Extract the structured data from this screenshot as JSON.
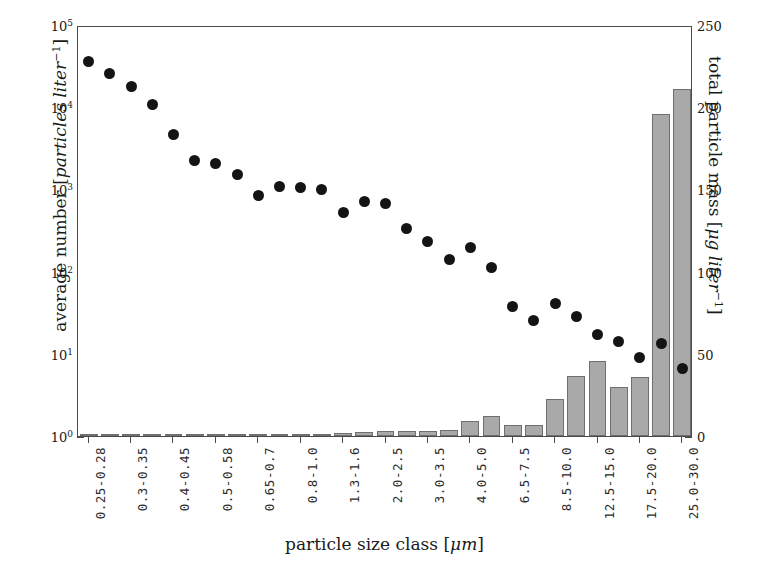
{
  "chart_data": {
    "type": "bar",
    "title": "",
    "xlabel": "particle size class [μm]",
    "ylabel": "average number [particles liter⁻¹]",
    "ylabel_right": "total particle mass [μg liter⁻¹]",
    "yscale": "log",
    "ylim": [
      1,
      100000
    ],
    "ylim_right": [
      0,
      250
    ],
    "grid": false,
    "legend": "none",
    "left_ticklabels": [
      "10⁰",
      "10¹",
      "10²",
      "10³",
      "10⁴",
      "10⁵"
    ],
    "left_tickvalues": [
      1,
      10,
      100,
      1000,
      10000,
      100000
    ],
    "right_ticklabels": [
      "0",
      "50",
      "100",
      "150",
      "200",
      "250"
    ],
    "right_tickvalues": [
      0,
      50,
      100,
      150,
      200,
      250
    ],
    "categories": [
      "0.25-0.28",
      "0.28-0.3",
      "0.3-0.35",
      "0.35-0.4",
      "0.4-0.45",
      "0.45-0.5",
      "0.5-0.58",
      "0.58-0.65",
      "0.65-0.7",
      "0.7-0.8",
      "0.8-1.0",
      "1.0-1.3",
      "1.3-1.6",
      "1.6-2.0",
      "2.0-2.5",
      "2.5-3.0",
      "3.0-3.5",
      "3.5-4.0",
      "4.0-5.0",
      "5.0-6.5",
      "6.5-7.5",
      "7.5-8.5",
      "8.5-10.0",
      "10.0-12.5",
      "12.5-15.0",
      "15.0-17.5",
      "17.5-20.0",
      "20.0-25.0",
      "25.0-30.0"
    ],
    "visible_tick_labels": [
      "0.25-0.28",
      "0.3-0.35",
      "0.4-0.45",
      "0.5-0.58",
      "0.65-0.7",
      "0.8-1.0",
      "1.3-1.6",
      "2.0-2.5",
      "3.0-3.5",
      "4.0-5.0",
      "6.5-7.5",
      "8.5-10.0",
      "12.5-15.0",
      "17.5-20.0",
      "25.0-30.0"
    ],
    "visible_tick_indices": [
      0,
      2,
      4,
      6,
      8,
      10,
      12,
      14,
      16,
      18,
      20,
      22,
      24,
      26,
      28
    ],
    "series": [
      {
        "name": "average number",
        "type": "scatter",
        "axis": "left",
        "unit": "particles liter^-1",
        "color": "#141414",
        "marker": "filled-circle",
        "values": [
          38000,
          27000,
          19000,
          11500,
          4900,
          2400,
          2200,
          1600,
          900,
          1150,
          1100,
          1050,
          560,
          760,
          720,
          350,
          245,
          150,
          205,
          120,
          40,
          27,
          43,
          30,
          18,
          15,
          9.5,
          14,
          7
        ]
      },
      {
        "name": "total particle mass",
        "type": "bar",
        "axis": "right",
        "unit": "microgram liter^-1",
        "color": "#a9a9a9",
        "edge_color": "#6f6f6f",
        "values": [
          0.6,
          0.6,
          0.7,
          0.7,
          0.8,
          0.8,
          0.9,
          0.9,
          1.0,
          1.2,
          1.3,
          1.5,
          1.6,
          2.2,
          3.1,
          3.0,
          3.1,
          3.6,
          9.2,
          12.3,
          6.6,
          6.6,
          22.6,
          36.5,
          45.5,
          30.1,
          36.0,
          196.0,
          211.0
        ]
      }
    ]
  }
}
